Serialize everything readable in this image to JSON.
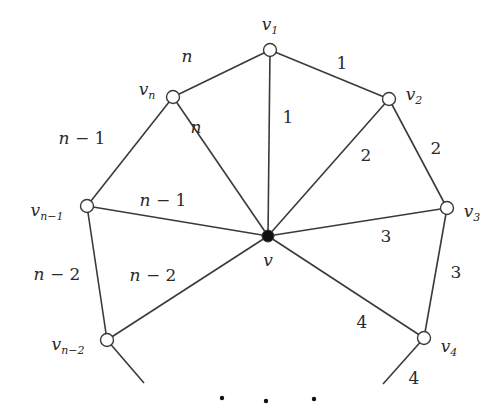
{
  "diagram": {
    "type": "wheel-graph-edge-labeling",
    "colors": {
      "edge": "#3a3a3a",
      "hub_fill": "#111111",
      "vertex_fill": "#ffffff",
      "text": "#2a2a2a"
    },
    "hub": {
      "id": "v",
      "label": "v",
      "x": 268,
      "y": 236
    },
    "vertices": [
      {
        "id": "v1",
        "base": "v",
        "sub": "1",
        "x": 270,
        "y": 50,
        "lx": 270,
        "ly": 24
      },
      {
        "id": "v2",
        "base": "v",
        "sub": "2",
        "x": 389,
        "y": 99,
        "lx": 414,
        "ly": 94
      },
      {
        "id": "v3",
        "base": "v",
        "sub": "3",
        "x": 447,
        "y": 208,
        "lx": 472,
        "ly": 211
      },
      {
        "id": "v4",
        "base": "v",
        "sub": "4",
        "x": 424,
        "y": 338,
        "lx": 449,
        "ly": 346
      },
      {
        "id": "vn",
        "base": "v",
        "sub": "n",
        "x": 173,
        "y": 97,
        "lx": 147,
        "ly": 89
      },
      {
        "id": "vn1",
        "base": "v",
        "sub": "n−1",
        "x": 87,
        "y": 206,
        "lx": 47,
        "ly": 210
      },
      {
        "id": "vn2",
        "base": "v",
        "sub": "n−2",
        "x": 107,
        "y": 340,
        "lx": 68,
        "ly": 344
      }
    ],
    "spoke_labels": [
      {
        "edge": "v-v1",
        "text": "1",
        "x": 288,
        "y": 117
      },
      {
        "edge": "v-v2",
        "text": "2",
        "x": 366,
        "y": 155
      },
      {
        "edge": "v-v3",
        "text": "3",
        "x": 386,
        "y": 236
      },
      {
        "edge": "v-v4",
        "text": "4",
        "x": 362,
        "y": 322
      },
      {
        "edge": "v-vn",
        "text": "n",
        "x": 196,
        "y": 127
      },
      {
        "edge": "v-vn1",
        "text": "n − 1",
        "x": 163,
        "y": 200
      },
      {
        "edge": "v-vn2",
        "text": "n − 2",
        "x": 153,
        "y": 275
      }
    ],
    "rim_labels": [
      {
        "edge": "v1-v2",
        "text": "1",
        "x": 342,
        "y": 63
      },
      {
        "edge": "v2-v3",
        "text": "2",
        "x": 436,
        "y": 148
      },
      {
        "edge": "v3-v4",
        "text": "3",
        "x": 456,
        "y": 272
      },
      {
        "edge": "v4-more",
        "text": "4",
        "x": 414,
        "y": 378
      },
      {
        "edge": "vn-v1",
        "text": "n",
        "x": 187,
        "y": 56
      },
      {
        "edge": "vn1-vn",
        "text": "n − 1",
        "x": 82,
        "y": 138
      },
      {
        "edge": "vn2-vn1",
        "text": "n − 2",
        "x": 57,
        "y": 274
      }
    ],
    "dangling_edges": [
      {
        "from": "vn2",
        "x2": 144,
        "y2": 383
      },
      {
        "from": "v4",
        "x2": 383,
        "y2": 384
      }
    ],
    "ellipsis_dots": [
      {
        "x": 222,
        "y": 398
      },
      {
        "x": 266,
        "y": 401
      },
      {
        "x": 314,
        "y": 399
      }
    ]
  }
}
